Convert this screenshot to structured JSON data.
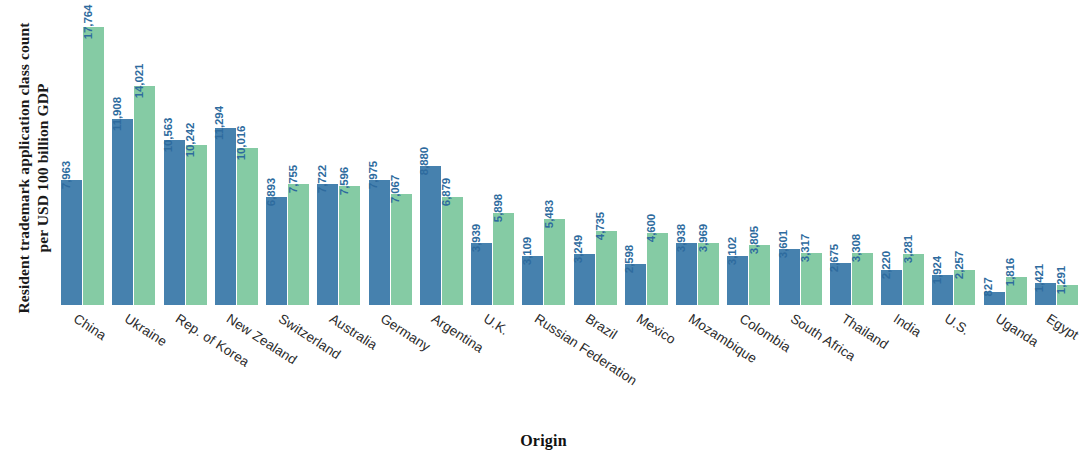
{
  "chart_data": {
    "type": "bar",
    "title": "",
    "xlabel": "Origin",
    "ylabel": "Resident trademark application class count per USD 100 billion GDP",
    "ylim": [
      0,
      18600
    ],
    "grid": false,
    "legend": "none",
    "orientation": "vertical",
    "grouping": "grouped",
    "categories": [
      "China",
      "Ukraine",
      "Rep. of Korea",
      "New Zealand",
      "Switzerland",
      "Australia",
      "Germany",
      "Argentina",
      "U.K.",
      "Russian Federation",
      "Brazil",
      "Mexico",
      "Mozambique",
      "Colombia",
      "South Africa",
      "Thailand",
      "India",
      "U.S.",
      "Uganda",
      "Egypt"
    ],
    "series": [
      {
        "name": "series-1",
        "color": "#4681AE",
        "values": [
          7963,
          11908,
          10563,
          11294,
          6893,
          7722,
          7975,
          8880,
          3939,
          3109,
          3249,
          2598,
          3938,
          3102,
          3601,
          2675,
          2220,
          1924,
          827,
          1421
        ],
        "labels": [
          "7,963",
          "11,908",
          "10,563",
          "11,294",
          "6,893",
          "7,722",
          "7,975",
          "8,880",
          "3,939",
          "3,109",
          "3,249",
          "2,598",
          "3,938",
          "3,102",
          "3,601",
          "2,675",
          "2,220",
          "1,924",
          "827",
          "1,421"
        ]
      },
      {
        "name": "series-2",
        "color": "#85CBA4",
        "values": [
          17764,
          14021,
          10242,
          10016,
          7755,
          7596,
          7067,
          6879,
          5898,
          5483,
          4735,
          4600,
          3969,
          3805,
          3317,
          3308,
          3281,
          2257,
          1816,
          1291
        ],
        "labels": [
          "17,764",
          "14,021",
          "10,242",
          "10,016",
          "7,755",
          "7,596",
          "7,067",
          "6,879",
          "5,898",
          "5,483",
          "4,735",
          "4,600",
          "3,969",
          "3,805",
          "3,317",
          "3,308",
          "3,281",
          "2,257",
          "1,816",
          "1,291"
        ]
      }
    ]
  }
}
